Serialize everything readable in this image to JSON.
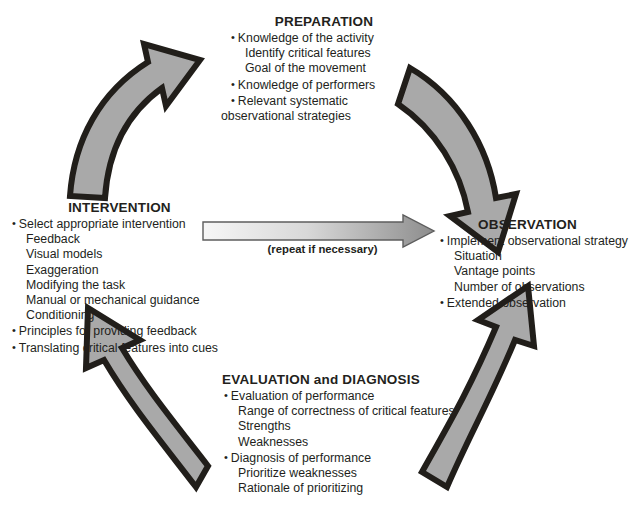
{
  "diagram": {
    "colors": {
      "arrow_fill": "#a9a9a9",
      "arrow_outline": "#211e1a",
      "text": "#231f1c",
      "center_arrow_light": "#f2f2f2",
      "center_arrow_dark": "#8d8d8d"
    },
    "center_arrow": {
      "label": "(repeat if necessary)",
      "direction": "left-to-right",
      "name": "repeat-if-necessary-arrow"
    },
    "cycle_arrows": [
      {
        "name": "arrow-intervention-to-preparation",
        "from": "INTERVENTION",
        "to": "PREPARATION",
        "position": "upper-left"
      },
      {
        "name": "arrow-preparation-to-observation",
        "from": "PREPARATION",
        "to": "OBSERVATION",
        "position": "upper-right"
      },
      {
        "name": "arrow-observation-to-evaluation",
        "from": "OBSERVATION",
        "to": "EVALUATION and DIAGNOSIS",
        "position": "lower-right"
      },
      {
        "name": "arrow-evaluation-to-intervention",
        "from": "EVALUATION and DIAGNOSIS",
        "to": "INTERVENTION",
        "position": "lower-left"
      }
    ],
    "stages": {
      "preparation": {
        "heading": "PREPARATION",
        "items": [
          {
            "text": "Knowledge of the activity",
            "bullet": true
          },
          {
            "text": "Identify critical features",
            "bullet": false
          },
          {
            "text": "Goal of the movement",
            "bullet": false
          },
          {
            "text": "Knowledge of performers",
            "bullet": true
          },
          {
            "text": "Relevant systematic",
            "bullet": true
          },
          {
            "text": "observational strategies",
            "bullet": false,
            "flush": true
          }
        ]
      },
      "observation": {
        "heading": "OBSERVATION",
        "items": [
          {
            "text": "Implement observational strategy",
            "bullet": true
          },
          {
            "text": "Situation",
            "bullet": false
          },
          {
            "text": "Vantage points",
            "bullet": false
          },
          {
            "text": "Number of observations",
            "bullet": false
          },
          {
            "text": "Extended observation",
            "bullet": true
          }
        ]
      },
      "evaluation": {
        "heading": "EVALUATION and DIAGNOSIS",
        "items": [
          {
            "text": "Evaluation of performance",
            "bullet": true
          },
          {
            "text": "Range of correctness of critical features",
            "bullet": false
          },
          {
            "text": "Strengths",
            "bullet": false
          },
          {
            "text": "Weaknesses",
            "bullet": false
          },
          {
            "text": "Diagnosis of performance",
            "bullet": true
          },
          {
            "text": "Prioritize weaknesses",
            "bullet": false
          },
          {
            "text": "Rationale of prioritizing",
            "bullet": false
          }
        ]
      },
      "intervention": {
        "heading": "INTERVENTION",
        "items": [
          {
            "text": "Select appropriate intervention",
            "bullet": true
          },
          {
            "text": "Feedback",
            "bullet": false
          },
          {
            "text": "Visual models",
            "bullet": false
          },
          {
            "text": "Exaggeration",
            "bullet": false
          },
          {
            "text": "Modifying the task",
            "bullet": false
          },
          {
            "text": "Manual or mechanical guidance",
            "bullet": false
          },
          {
            "text": "Conditioning",
            "bullet": false
          },
          {
            "text": "Principles for providing feedback",
            "bullet": true
          },
          {
            "text": "Translating critical features into cues",
            "bullet": true
          }
        ]
      }
    }
  }
}
